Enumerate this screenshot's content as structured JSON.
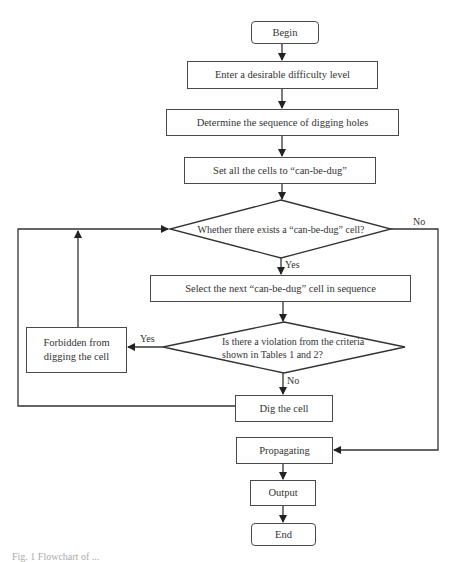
{
  "diagram": {
    "type": "flowchart",
    "nodes": {
      "begin": "Begin",
      "enter": "Enter a desirable difficulty level",
      "determine": "Determine the sequence of digging holes",
      "set_all": "Set all the cells to “can-be-dug”",
      "exists": "Whether there exists a “can-be-dug” cell?",
      "select": "Select the next “can-be-dug” cell in sequence",
      "violation_line1": "Is there a violation from the criteria",
      "violation_line2": "shown in Tables 1 and 2?",
      "forbidden_line1": "Forbidden from",
      "forbidden_line2": "digging the cell",
      "dig": "Dig the cell",
      "propagating": "Propagating",
      "output": "Output",
      "end": "End"
    },
    "edge_labels": {
      "exists_no": "No",
      "exists_yes": "Yes",
      "violation_yes": "Yes",
      "violation_no": "No"
    },
    "edges": [
      [
        "begin",
        "enter"
      ],
      [
        "enter",
        "determine"
      ],
      [
        "determine",
        "set_all"
      ],
      [
        "set_all",
        "exists"
      ],
      [
        "exists",
        "select",
        "Yes"
      ],
      [
        "exists",
        "propagating",
        "No"
      ],
      [
        "select",
        "violation"
      ],
      [
        "violation",
        "forbidden",
        "Yes"
      ],
      [
        "violation",
        "dig",
        "No"
      ],
      [
        "forbidden",
        "exists"
      ],
      [
        "dig",
        "exists"
      ],
      [
        "propagating",
        "output"
      ],
      [
        "output",
        "end"
      ]
    ]
  },
  "caption": "Fig. 1  Flowchart of ..."
}
